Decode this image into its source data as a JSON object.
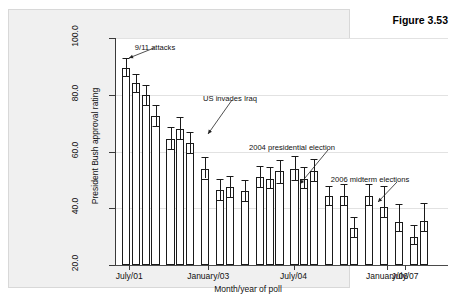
{
  "figure": {
    "number_label": "Figure 3.53"
  },
  "chart_data": {
    "type": "bar",
    "title": "",
    "xlabel": "Month/year of poll",
    "ylabel": "President Bush approval rating",
    "ylim": [
      20.0,
      100.0
    ],
    "yticks": [
      20.0,
      40.0,
      60.0,
      80.0,
      100.0
    ],
    "ytick_labels": [
      "20.0",
      "40.0",
      "60.0",
      "80.0",
      "100.0"
    ],
    "grid": true,
    "legend": "none",
    "xtick_labels": [
      "July/01",
      "January/03",
      "July/04",
      "January/06",
      "July/07"
    ],
    "xtick_positions": [
      0.5,
      7.5,
      14.0,
      21.5,
      27.5
    ],
    "groups": [
      {
        "name": "late-2001",
        "bars": [
          {
            "index": 0,
            "value": 89.5,
            "err_low": 86.5,
            "err_high": 93.0
          },
          {
            "index": 1,
            "value": 84.0,
            "err_low": 81.0,
            "err_high": 87.5
          },
          {
            "index": 2,
            "value": 80.0,
            "err_low": 76.5,
            "err_high": 83.5
          },
          {
            "index": 3,
            "value": 72.5,
            "err_low": 69.0,
            "err_high": 76.5
          }
        ]
      },
      {
        "name": "early-2003",
        "bars": [
          {
            "index": 4,
            "value": 64.5,
            "err_low": 61.0,
            "err_high": 68.5
          },
          {
            "index": 5,
            "value": 68.0,
            "err_low": 64.5,
            "err_high": 72.0
          },
          {
            "index": 6,
            "value": 63.0,
            "err_low": 59.5,
            "err_high": 67.0
          }
        ]
      },
      {
        "name": "mid-2003",
        "bars": [
          {
            "index": 7,
            "value": 54.0,
            "err_low": 50.5,
            "err_high": 58.0
          }
        ]
      },
      {
        "name": "late-2003",
        "bars": [
          {
            "index": 8,
            "value": 46.5,
            "err_low": 43.0,
            "err_high": 50.5
          },
          {
            "index": 9,
            "value": 47.5,
            "err_low": 44.0,
            "err_high": 51.5
          }
        ]
      },
      {
        "name": "early-2004",
        "bars": [
          {
            "index": 10,
            "value": 46.0,
            "err_low": 42.5,
            "err_high": 50.0
          }
        ]
      },
      {
        "name": "mid-2004",
        "bars": [
          {
            "index": 11,
            "value": 51.0,
            "err_low": 47.5,
            "err_high": 55.0
          },
          {
            "index": 12,
            "value": 50.5,
            "err_low": 47.0,
            "err_high": 54.5
          },
          {
            "index": 13,
            "value": 53.0,
            "err_low": 49.0,
            "err_high": 57.0
          }
        ]
      },
      {
        "name": "late-2004",
        "bars": [
          {
            "index": 14,
            "value": 54.0,
            "err_low": 50.0,
            "err_high": 58.5
          },
          {
            "index": 15,
            "value": 50.5,
            "err_low": 47.0,
            "err_high": 54.5
          },
          {
            "index": 16,
            "value": 53.0,
            "err_low": 49.5,
            "err_high": 57.5
          }
        ]
      },
      {
        "name": "2005",
        "bars": [
          {
            "index": 17,
            "value": 44.5,
            "err_low": 41.0,
            "err_high": 48.0
          }
        ]
      },
      {
        "name": "early-2006",
        "bars": [
          {
            "index": 18,
            "value": 44.5,
            "err_low": 41.0,
            "err_high": 48.5
          },
          {
            "index": 19,
            "value": 33.0,
            "err_low": 30.0,
            "err_high": 37.0
          }
        ]
      },
      {
        "name": "mid-2006",
        "bars": [
          {
            "index": 20,
            "value": 44.5,
            "err_low": 41.0,
            "err_high": 48.5
          }
        ]
      },
      {
        "name": "late-2006",
        "bars": [
          {
            "index": 21,
            "value": 40.5,
            "err_low": 37.0,
            "err_high": 48.0
          }
        ]
      },
      {
        "name": "early-2007",
        "bars": [
          {
            "index": 22,
            "value": 35.0,
            "err_low": 32.0,
            "err_high": 41.5
          }
        ]
      },
      {
        "name": "mid-2007",
        "bars": [
          {
            "index": 23,
            "value": 30.0,
            "err_low": 27.5,
            "err_high": 34.0
          },
          {
            "index": 24,
            "value": 35.5,
            "err_low": 32.0,
            "err_high": 42.0
          }
        ]
      }
    ],
    "annotations": [
      {
        "id": "annotation-911",
        "text": "9/11 attacks",
        "label_x": 95,
        "label_y": 27,
        "arrow_from_x": 94,
        "arrow_from_y": 32,
        "arrow_to_x": 69,
        "arrow_to_y": 42
      },
      {
        "id": "annotation-iraq",
        "text": "US invades Iraq",
        "label_x": 170,
        "label_y": 78,
        "arrow_from_x": 172,
        "arrow_from_y": 84,
        "arrow_to_x": 148,
        "arrow_to_y": 118
      },
      {
        "id": "annotation-2004-election",
        "text": "2004 presidential election",
        "label_x": 232,
        "label_y": 127,
        "arrow_from_x": 268,
        "arrow_from_y": 134,
        "arrow_to_x": 240,
        "arrow_to_y": 168
      },
      {
        "id": "annotation-2006-midterms",
        "text": "2006 midterm elections",
        "label_x": 310,
        "label_y": 159,
        "arrow_from_x": 337,
        "arrow_from_y": 166,
        "arrow_to_x": 318,
        "arrow_to_y": 186
      }
    ]
  }
}
